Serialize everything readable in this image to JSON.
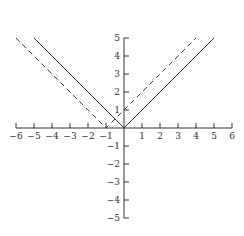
{
  "chart_data": {
    "type": "line",
    "title": "",
    "xlabel": "",
    "ylabel": "",
    "xlim": [
      -6,
      6
    ],
    "ylim": [
      -5,
      5
    ],
    "grid": false,
    "legend": null,
    "x_ticks": [
      -6,
      -5,
      -4,
      -3,
      -2,
      -1,
      1,
      2,
      3,
      4,
      5,
      6
    ],
    "y_ticks": [
      -5,
      -4,
      -3,
      -2,
      -1,
      1,
      2,
      3,
      4,
      5
    ],
    "x_tick_labels": [
      "−6",
      "−5",
      "−4",
      "−3",
      "−2",
      "−1",
      "1",
      "2",
      "3",
      "4",
      "5",
      "6"
    ],
    "y_tick_labels": [
      "−5",
      "−4",
      "−3",
      "−2",
      "−1",
      "1",
      "2",
      "3",
      "4",
      "5"
    ],
    "series": [
      {
        "name": "y = |x|",
        "style": "solid",
        "color": "#333333",
        "x": [
          -5,
          0,
          5
        ],
        "y": [
          5,
          0,
          5
        ]
      },
      {
        "name": "y = |x + 1|",
        "style": "dashed",
        "color": "#333333",
        "x": [
          -6,
          -1,
          4
        ],
        "y": [
          5,
          0,
          5
        ]
      }
    ]
  },
  "layout": {
    "origin_px": [
      124,
      128
    ],
    "unit_px": 18
  }
}
